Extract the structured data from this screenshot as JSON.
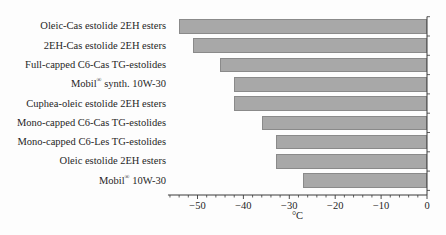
{
  "figure": {
    "background": "#fdfdfd",
    "bar_fill": "#a8a8a8",
    "bar_border": "#8a8a8a",
    "axis_color": "#3a3a3a",
    "text_color": "#262626"
  },
  "chart_data": {
    "type": "bar",
    "orientation": "horizontal",
    "title": "",
    "xlabel": "°C",
    "ylabel": "",
    "xlim": [
      -56,
      0
    ],
    "x_major_ticks": [
      -50,
      -40,
      -30,
      -20,
      -10,
      0
    ],
    "x_tick_labels": [
      "−50",
      "−40",
      "−30",
      "−20",
      "−10",
      "0"
    ],
    "x_minor_tick_step": 2,
    "grid": false,
    "legend": false,
    "categories": [
      "Oleic-Cas estolide 2EH esters",
      "2EH-Cas estolide 2EH esters",
      "Full-capped C6-Cas TG-estolides",
      "Mobil® synth. 10W-30",
      "Cuphea-oleic estolide 2EH esters",
      "Mono-capped C6-Cas TG-estolides",
      "Mono-capped C6-Les TG-estolides",
      "Oleic estolide 2EH esters",
      "Mobil® 10W-30"
    ],
    "values": [
      -54,
      -51,
      -45,
      -42,
      -42,
      -36,
      -33,
      -33,
      -27
    ]
  }
}
